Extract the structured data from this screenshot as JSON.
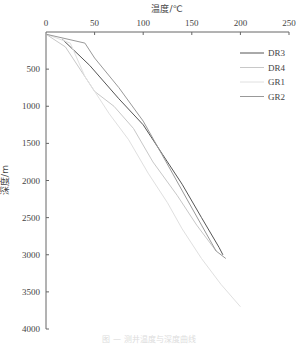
{
  "chart_data": {
    "type": "line",
    "title": "",
    "xlabel": "温度/℃",
    "ylabel": "深度/m",
    "x_axis_position": "top",
    "y_axis_inverted": true,
    "xlim": [
      0,
      250
    ],
    "ylim": [
      0,
      4000
    ],
    "x_ticks": [
      0,
      50,
      100,
      150,
      200,
      250
    ],
    "y_ticks": [
      0,
      500,
      1000,
      1500,
      2000,
      2500,
      3000,
      3500,
      4000
    ],
    "grid": false,
    "legend_position": "upper right",
    "series": [
      {
        "name": "DR3",
        "color": "#555555",
        "points": [
          [
            17,
            100
          ],
          [
            45,
            450
          ],
          [
            75,
            900
          ],
          [
            100,
            1250
          ],
          [
            120,
            1650
          ],
          [
            140,
            2050
          ],
          [
            160,
            2500
          ],
          [
            178,
            2900
          ],
          [
            182,
            3000
          ]
        ]
      },
      {
        "name": "DR4",
        "color": "#c8c8c8",
        "points": [
          [
            0,
            30
          ],
          [
            20,
            200
          ],
          [
            35,
            500
          ],
          [
            50,
            800
          ],
          [
            70,
            1000
          ],
          [
            90,
            1300
          ],
          [
            110,
            1750
          ],
          [
            135,
            2200
          ],
          [
            155,
            2600
          ],
          [
            175,
            2950
          ]
        ]
      },
      {
        "name": "GR1",
        "color": "#e0e0e0",
        "points": [
          [
            0,
            30
          ],
          [
            25,
            150
          ],
          [
            40,
            600
          ],
          [
            55,
            900
          ],
          [
            65,
            1100
          ],
          [
            85,
            1450
          ],
          [
            105,
            1900
          ],
          [
            125,
            2300
          ],
          [
            140,
            2650
          ],
          [
            160,
            3050
          ],
          [
            180,
            3400
          ],
          [
            200,
            3700
          ]
        ]
      },
      {
        "name": "GR2",
        "color": "#999999",
        "points": [
          [
            0,
            30
          ],
          [
            40,
            150
          ],
          [
            50,
            350
          ],
          [
            75,
            750
          ],
          [
            100,
            1200
          ],
          [
            115,
            1550
          ],
          [
            130,
            1900
          ],
          [
            145,
            2250
          ],
          [
            160,
            2600
          ],
          [
            175,
            2950
          ],
          [
            185,
            3050
          ]
        ]
      }
    ]
  },
  "axes": {
    "x_title": "温度/℃",
    "y_title": "深度/m",
    "x_tick_labels": [
      "0",
      "50",
      "100",
      "150",
      "200",
      "250"
    ],
    "y_tick_labels": [
      "500",
      "1000",
      "1500",
      "2000",
      "2500",
      "3000",
      "3500",
      "4000"
    ]
  },
  "legend": {
    "items": [
      {
        "label": "DR3",
        "color": "#555555"
      },
      {
        "label": "DR4",
        "color": "#c8c8c8"
      },
      {
        "label": "GR1",
        "color": "#e0e0e0"
      },
      {
        "label": "GR2",
        "color": "#999999"
      }
    ]
  },
  "caption": "图 — 测井温度与深度曲线"
}
